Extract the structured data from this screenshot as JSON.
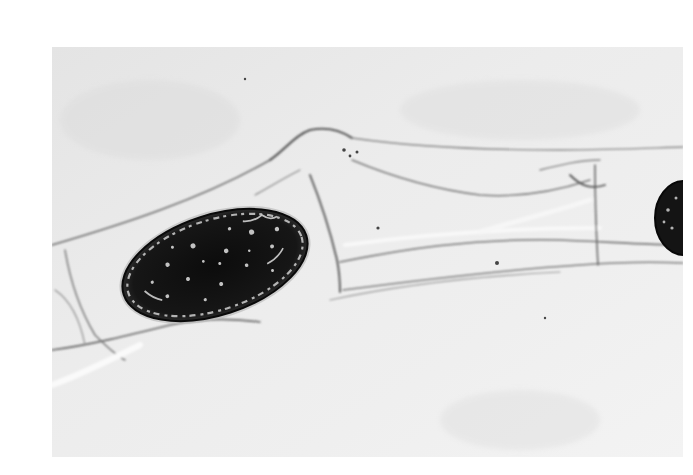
{
  "image": {
    "kind": "grayscale light micrograph",
    "subject": "dark ovoid spore/cell inside translucent hyphal strands",
    "frame": {
      "left": 52,
      "top": 47,
      "width": 631,
      "height": 410
    },
    "colors": {
      "page_background": "#ffffff",
      "photo_background": "#e8e8e8",
      "photo_background_light": "#f2f2f2",
      "cell_wall_lines": "#6a6a6a",
      "spore_fill": "#111111",
      "spore_highlight": "#d8d8d8"
    },
    "objects": [
      {
        "name": "main-spore",
        "shape": "ellipse",
        "cx": 215,
        "cy": 265,
        "rx": 98,
        "ry": 53,
        "rotation_deg": -18
      },
      {
        "name": "partial-spore-right",
        "shape": "ellipse",
        "cx": 683,
        "cy": 218,
        "rx": 28,
        "ry": 36
      },
      {
        "name": "hyphae-strands",
        "shape": "lines",
        "count": 12
      }
    ]
  }
}
